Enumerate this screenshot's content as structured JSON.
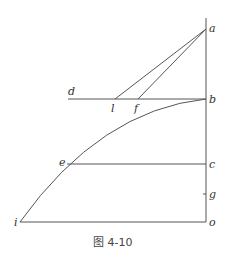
{
  "caption": "图 4-10",
  "labels": {
    "a": "a",
    "b": "b",
    "c": "c",
    "d": "d",
    "e": "e",
    "f": "f",
    "g": "g",
    "i": "i",
    "l": "l",
    "o": "o"
  },
  "colors": {
    "stroke": "#555555",
    "text": "#333333"
  }
}
